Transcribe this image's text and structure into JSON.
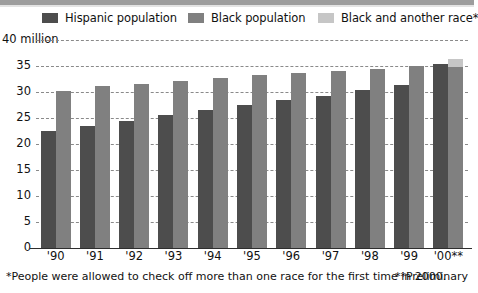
{
  "legend": {
    "items": [
      {
        "label": "Hispanic population",
        "color": "#4d4d4d",
        "icon": "legend-swatch-icon"
      },
      {
        "label": "Black population",
        "color": "#808080",
        "icon": "legend-swatch-icon"
      },
      {
        "label": "Black and another race*",
        "color": "#c6c6c6",
        "icon": "legend-swatch-icon"
      }
    ]
  },
  "footnotes": {
    "left": "*People were allowed to check off more than one race for the first time in 2000.",
    "right": "**Preliminary"
  },
  "chart_data": {
    "type": "bar",
    "title": "",
    "subtitle": "",
    "xlabel": "",
    "ylabel": "",
    "axis_top_label": "40 million",
    "ylim": [
      0,
      40
    ],
    "yticks": [
      0,
      5,
      10,
      15,
      20,
      25,
      30,
      35,
      40
    ],
    "ytick_labels": [
      "0",
      "5",
      "10",
      "15",
      "20",
      "25",
      "30",
      "35",
      "40 million"
    ],
    "grid": true,
    "grid_style": "dashed",
    "legend_position": "top",
    "categories": [
      "'90",
      "'91",
      "'92",
      "'93",
      "'94",
      "'95",
      "'96",
      "'97",
      "'98",
      "'99",
      "'00**"
    ],
    "series": [
      {
        "name": "Hispanic population",
        "color": "#4d4d4d",
        "values": [
          22.5,
          23.4,
          24.4,
          25.5,
          26.5,
          27.5,
          28.4,
          29.3,
          30.3,
          31.4,
          35.3
        ]
      },
      {
        "name": "Black population",
        "color": "#808080",
        "values": [
          30.2,
          31.1,
          31.6,
          32.1,
          32.7,
          33.2,
          33.7,
          34.1,
          34.5,
          35.0,
          34.9
        ]
      },
      {
        "name": "Black and another race*",
        "color": "#c6c6c6",
        "stacked_on": "Black population",
        "values": [
          0,
          0,
          0,
          0,
          0,
          0,
          0,
          0,
          0,
          0,
          1.5
        ]
      }
    ],
    "annotations": [
      "*People were allowed to check off more than one race for the first time in 2000.",
      "**Preliminary"
    ]
  }
}
